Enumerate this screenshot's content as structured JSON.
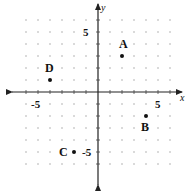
{
  "chart_data": {
    "type": "scatter",
    "title": "",
    "xlabel": "x",
    "ylabel": "y",
    "xlim": [
      -6,
      6
    ],
    "ylim": [
      -6,
      6
    ],
    "grid": "dotted lattice (integer points)",
    "tick_labels": {
      "x": [
        {
          "value": -5,
          "label": "-5"
        },
        {
          "value": 5,
          "label": "5"
        }
      ],
      "y": [
        {
          "value": 5,
          "label": "5"
        },
        {
          "value": -5,
          "label": "-5"
        }
      ]
    },
    "points": [
      {
        "label": "A",
        "x": 2,
        "y": 3
      },
      {
        "label": "B",
        "x": 4,
        "y": -2
      },
      {
        "label": "C",
        "x": -2,
        "y": -5
      },
      {
        "label": "D",
        "x": -4,
        "y": 1
      }
    ]
  },
  "layout": {
    "origin_px": [
      98,
      92
    ],
    "unit_px": 12,
    "colors": {
      "axis": "#222222",
      "grid_dot": "#9a9a9a",
      "point": "#111111"
    }
  }
}
